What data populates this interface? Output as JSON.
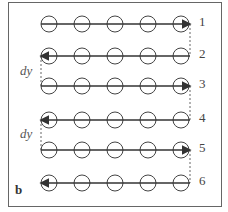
{
  "diagram": {
    "panel_label": "b",
    "spacing_label": "dy",
    "rows": [
      {
        "label": "1",
        "direction": "right"
      },
      {
        "label": "2",
        "direction": "left"
      },
      {
        "label": "3",
        "direction": "right"
      },
      {
        "label": "4",
        "direction": "left"
      },
      {
        "label": "5",
        "direction": "right"
      },
      {
        "label": "6",
        "direction": "left"
      }
    ],
    "circles_per_row": 5,
    "colors": {
      "stroke": "#333333",
      "frame": "#555555",
      "background": "#ffffff"
    }
  }
}
